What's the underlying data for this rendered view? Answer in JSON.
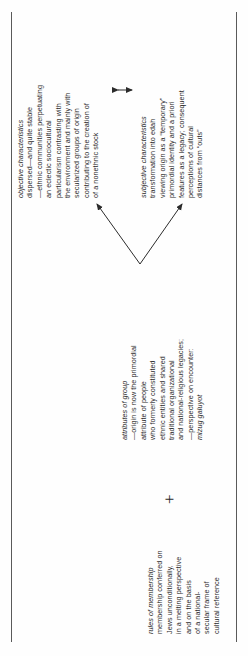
{
  "figure": {
    "orientation": "rotated-90-ccw",
    "plus_symbol": "+",
    "blocks": {
      "rules_of_membership": {
        "heading": "rules of membership",
        "lines": [
          "membership conferred on",
          "Jews unconditionally,",
          "in a melting perspective",
          "and on the basis",
          "of a national-",
          "secular frame of",
          "cultural reference"
        ]
      },
      "attributes_of_group": {
        "heading": "attributes of group",
        "lines": [
          "—origin is now the primordial",
          "attribute of people",
          "who formerly constituted",
          "ethnic entities and shared",
          "traditional organizational",
          "and national-religious legacies;",
          "—perspective on encounter:"
        ],
        "term": "mizug galuyot"
      },
      "objective_characteristics": {
        "heading": "objective characteristics",
        "lines": [
          "dispersed—and quite stable",
          "—ethnic communities perpetuating",
          "an eclectic sociocultural",
          "particularism contrasting with",
          "the environment and mainly with",
          "secularized groups of origin",
          "contributing to the creation of",
          "of a nonethnic stock"
        ]
      },
      "subjective_characteristics": {
        "heading": "subjective characteristics",
        "lines": [
          "transformation into edah",
          "viewing origin as a “temporary”",
          "primordial identity and a priori",
          "features as a legacy; consequent",
          "perceptions of cultural",
          "distances from “outs”"
        ]
      }
    },
    "connectors": {
      "branch_left": "arrow-up-left",
      "branch_right": "arrow-up-right",
      "between_outcomes": "double-headed-arrow"
    },
    "colors": {
      "ink": "#2b2b2b",
      "rule": "#5a5a5a",
      "paper": "#fefefe"
    }
  }
}
